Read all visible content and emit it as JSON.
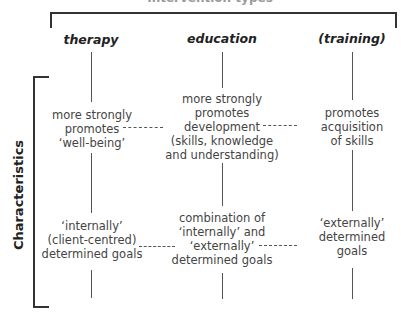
{
  "diagram": {
    "top_title": "Intervention types",
    "side_label": "Characteristics",
    "columns": [
      {
        "label": "therapy"
      },
      {
        "label": "education"
      },
      {
        "label": "(training)"
      }
    ],
    "row1": [
      {
        "lines": [
          "more strongly",
          "promotes",
          "‘well-being’"
        ]
      },
      {
        "lines": [
          "more strongly",
          "promotes",
          "development",
          "(skills, knowledge",
          "and understanding)"
        ]
      },
      {
        "lines": [
          "promotes",
          "acquisition",
          "of skills"
        ]
      }
    ],
    "row2": [
      {
        "lines": [
          "‘internally’",
          "(client-centred)",
          "determined goals"
        ]
      },
      {
        "lines": [
          "combination of",
          "‘internally’ and",
          "‘externally’",
          "determined goals"
        ]
      },
      {
        "lines": [
          "‘externally’",
          "determined",
          "goals"
        ]
      }
    ]
  }
}
